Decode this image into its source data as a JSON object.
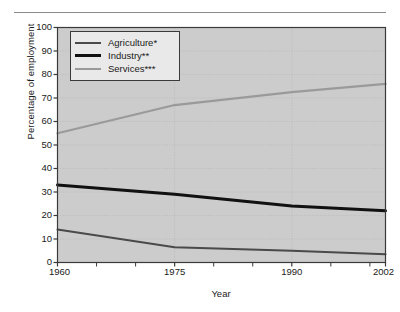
{
  "chart_data": {
    "type": "line",
    "title": "",
    "xlabel": "Year",
    "ylabel": "Percentage of employment",
    "x": [
      1960,
      1975,
      1990,
      2002
    ],
    "xlim": [
      1960,
      2002
    ],
    "ylim": [
      0,
      100
    ],
    "xticks": [
      "1960",
      "1975",
      "1990",
      "2002"
    ],
    "yticks": [
      "0",
      "10",
      "20",
      "30",
      "40",
      "50",
      "60",
      "70",
      "80",
      "90",
      "100"
    ],
    "minor_xticks": [
      1965,
      1970,
      1980,
      1985,
      1995,
      2000
    ],
    "grid": true,
    "legend_position": "top-left inside plot",
    "series": [
      {
        "name": "Agriculture*",
        "color": "#4a4a4a",
        "line_width": 2.0,
        "values": [
          14,
          6.5,
          5,
          3.5
        ]
      },
      {
        "name": "Industry**",
        "color": "#111111",
        "line_width": 3.0,
        "values": [
          33,
          29,
          24,
          22
        ]
      },
      {
        "name": "Services***",
        "color": "#9a9a9a",
        "line_width": 2.2,
        "values": [
          55,
          67,
          72.5,
          76
        ]
      }
    ]
  },
  "style": {
    "plot_background": "#cccccc",
    "page_background": "#ffffff",
    "axis_color": "#3a3a3a",
    "grid_color": "#b6b6b6",
    "rule_color": "#8a8a8a"
  },
  "legend": {
    "items": [
      {
        "label": "Agriculture*"
      },
      {
        "label": "Industry**"
      },
      {
        "label": "Services***"
      }
    ]
  }
}
